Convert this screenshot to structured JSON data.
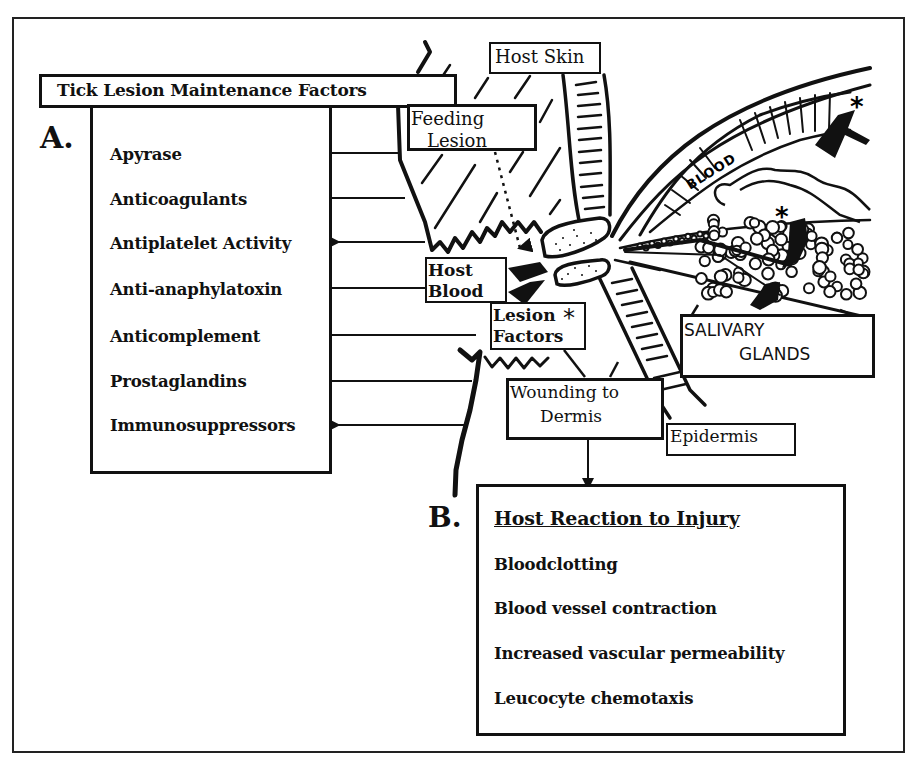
{
  "figure": {
    "panel_a_letter": "A.",
    "panel_b_letter": "B.",
    "maintenance_box": {
      "title": "Tick Lesion Maintenance Factors",
      "factors": [
        "Apyrase",
        "Anticoagulants",
        "Antiplatelet Activity",
        "Anti-anaphylatoxin",
        "Anticomplement",
        "Prostaglandins",
        "Immunosuppressors"
      ]
    },
    "anatomy_labels": {
      "host_skin": "Host Skin",
      "feeding_lesion_line1": "Feeding",
      "feeding_lesion_line2": "Lesion",
      "host_blood_line1": "Host",
      "host_blood_line2": "Blood",
      "lesion_factors_line1": "Lesion",
      "lesion_factors_line2": "Factors",
      "lesion_factors_marker": "*",
      "blood": "BLOOD",
      "salivary_line1": "SALIVARY",
      "salivary_line2": "GLANDS",
      "wounding_line1": "Wounding to",
      "wounding_line2": "Dermis",
      "epidermis": "Epidermis",
      "gland_marker_upper": "*",
      "gland_marker_lower": "*"
    },
    "reaction_box": {
      "title": "Host Reaction to Injury",
      "items": [
        "Bloodclotting",
        "Blood vessel contraction",
        "Increased vascular permeability",
        "Leucocyte chemotaxis"
      ]
    }
  }
}
